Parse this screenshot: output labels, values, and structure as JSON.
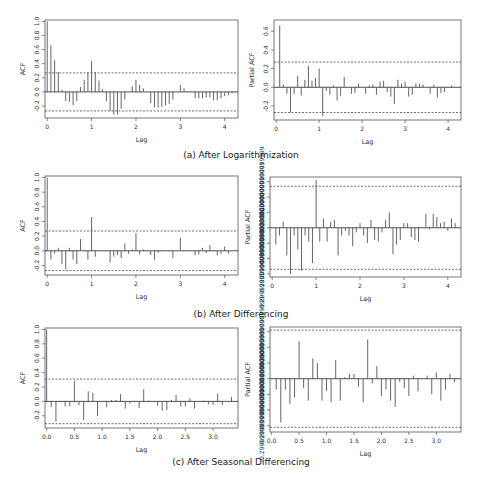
{
  "figure": {
    "captions": {
      "a": "(a) After Logarithmization",
      "b": "(b) After Differencing",
      "c": "(c) After Seasonal Differencing"
    }
  },
  "chart_data": [
    {
      "id": "a_acf",
      "type": "bar",
      "title": "",
      "xlabel": "Lag",
      "ylabel": "ACF",
      "xlim": [
        -0.05,
        4.3
      ],
      "ylim": [
        -0.37,
        1.02
      ],
      "xticks": [
        0,
        1,
        2,
        3,
        4
      ],
      "yticks": [
        -0.2,
        0.0,
        0.2,
        0.4,
        0.6,
        0.8,
        1.0
      ],
      "ci": 0.27,
      "grid": false,
      "x": [
        0,
        0.083,
        0.167,
        0.25,
        0.333,
        0.417,
        0.5,
        0.583,
        0.667,
        0.75,
        0.833,
        0.917,
        1.0,
        1.083,
        1.167,
        1.25,
        1.333,
        1.417,
        1.5,
        1.583,
        1.667,
        1.75,
        1.833,
        1.917,
        2.0,
        2.083,
        2.167,
        2.25,
        2.333,
        2.417,
        2.5,
        2.583,
        2.667,
        2.75,
        2.833,
        2.917,
        3.0,
        3.083,
        3.167,
        3.25,
        3.333,
        3.417,
        3.5,
        3.583,
        3.667,
        3.75,
        3.833,
        3.917,
        4.0,
        4.083,
        4.167
      ],
      "values": [
        1.0,
        0.66,
        0.45,
        0.28,
        0.03,
        -0.13,
        -0.14,
        -0.19,
        -0.13,
        0.07,
        0.17,
        0.28,
        0.44,
        0.28,
        0.16,
        0.04,
        -0.13,
        -0.27,
        -0.32,
        -0.32,
        -0.24,
        -0.11,
        0.0,
        0.08,
        0.17,
        0.1,
        0.05,
        0.0,
        -0.16,
        -0.22,
        -0.22,
        -0.21,
        -0.19,
        -0.17,
        -0.11,
        0.0,
        0.1,
        0.05,
        0.01,
        0.0,
        -0.09,
        -0.09,
        -0.09,
        -0.08,
        -0.08,
        -0.12,
        -0.12,
        -0.09,
        -0.06,
        -0.05,
        -0.02
      ]
    },
    {
      "id": "a_pacf",
      "type": "bar",
      "title": "",
      "xlabel": "Lag",
      "ylabel": "Partial ACF",
      "xlim": [
        -0.05,
        4.3
      ],
      "ylim": [
        -0.35,
        0.72
      ],
      "xticks": [
        0,
        1,
        2,
        3,
        4
      ],
      "yticks": [
        -0.2,
        0.0,
        0.2,
        0.4,
        0.6
      ],
      "ci": 0.27,
      "grid": false,
      "x": [
        0.083,
        0.167,
        0.25,
        0.333,
        0.417,
        0.5,
        0.583,
        0.667,
        0.75,
        0.833,
        0.917,
        1.0,
        1.083,
        1.167,
        1.25,
        1.333,
        1.417,
        1.5,
        1.583,
        1.667,
        1.75,
        1.833,
        1.917,
        2.0,
        2.083,
        2.167,
        2.25,
        2.333,
        2.417,
        2.5,
        2.583,
        2.667,
        2.75,
        2.833,
        2.917,
        3.0,
        3.083,
        3.167,
        3.25,
        3.333,
        3.417,
        3.5,
        3.583,
        3.667,
        3.75,
        3.833,
        3.917,
        4.0,
        4.083
      ],
      "values": [
        0.66,
        0.03,
        -0.07,
        -0.27,
        -0.07,
        0.12,
        -0.09,
        0.08,
        0.23,
        0.07,
        0.1,
        0.2,
        -0.31,
        -0.04,
        -0.08,
        0.02,
        -0.14,
        -0.09,
        0.11,
        0.0,
        -0.07,
        -0.06,
        0.04,
        0.0,
        -0.07,
        0.02,
        0.03,
        -0.08,
        0.06,
        0.07,
        -0.05,
        -0.1,
        -0.18,
        0.08,
        0.04,
        0.06,
        -0.1,
        -0.08,
        0.04,
        0.04,
        0.03,
        0.0,
        -0.07,
        0.03,
        -0.11,
        -0.06,
        -0.05,
        0.0,
        0.02
      ]
    },
    {
      "id": "b_acf",
      "type": "bar",
      "title": "",
      "xlabel": "Lag",
      "ylabel": "ACF",
      "xlim": [
        -0.05,
        4.3
      ],
      "ylim": [
        -0.33,
        1.02
      ],
      "xticks": [
        0,
        1,
        2,
        3,
        4
      ],
      "yticks": [
        -0.2,
        0.0,
        0.2,
        0.4,
        0.6,
        0.8,
        1.0
      ],
      "ci": 0.27,
      "grid": false,
      "x": [
        0,
        0.083,
        0.167,
        0.25,
        0.333,
        0.417,
        0.5,
        0.583,
        0.667,
        0.75,
        0.833,
        0.917,
        1.0,
        1.083,
        1.167,
        1.25,
        1.333,
        1.417,
        1.5,
        1.583,
        1.667,
        1.75,
        1.833,
        1.917,
        2.0,
        2.083,
        2.167,
        2.25,
        2.333,
        2.417,
        2.5,
        2.583,
        2.667,
        2.75,
        2.833,
        2.917,
        3.0,
        3.083,
        3.167,
        3.25,
        3.333,
        3.417,
        3.5,
        3.583,
        3.667,
        3.75,
        3.833,
        3.917,
        4.0,
        4.083,
        4.167
      ],
      "values": [
        1.0,
        -0.12,
        -0.04,
        0.04,
        -0.18,
        -0.25,
        0.04,
        -0.12,
        -0.18,
        0.16,
        0.01,
        -0.12,
        0.46,
        -0.08,
        0.01,
        0.01,
        0.0,
        -0.16,
        -0.08,
        -0.06,
        -0.1,
        0.1,
        -0.04,
        0.02,
        0.24,
        -0.05,
        0.02,
        0.01,
        -0.06,
        -0.12,
        -0.03,
        0.01,
        0.0,
        0.01,
        -0.1,
        0.0,
        0.18,
        0.01,
        0.01,
        0.0,
        -0.06,
        -0.05,
        0.04,
        -0.03,
        0.08,
        0.01,
        -0.06,
        -0.04,
        0.06,
        -0.04,
        0.0
      ]
    },
    {
      "id": "b_pacf",
      "type": "bar",
      "title": "",
      "xlabel": "Lag",
      "ylabel": "Partial ACF",
      "xlim": [
        -0.05,
        4.3
      ],
      "ylim": [
        -0.32,
        0.33
      ],
      "xticks": [
        0,
        1,
        2,
        3,
        4
      ],
      "yticks": [
        -0.3,
        -0.2,
        -0.1,
        0.0,
        0.1,
        0.2,
        0.3
      ],
      "ci": 0.27,
      "grid": false,
      "x": [
        0.083,
        0.167,
        0.25,
        0.333,
        0.417,
        0.5,
        0.583,
        0.667,
        0.75,
        0.833,
        0.917,
        1.0,
        1.083,
        1.167,
        1.25,
        1.333,
        1.417,
        1.5,
        1.583,
        1.667,
        1.75,
        1.833,
        1.917,
        2.0,
        2.083,
        2.167,
        2.25,
        2.333,
        2.417,
        2.5,
        2.583,
        2.667,
        2.75,
        2.833,
        2.917,
        3.0,
        3.083,
        3.167,
        3.25,
        3.333,
        3.417,
        3.5,
        3.583,
        3.667,
        3.75,
        3.833,
        3.917,
        4.0,
        4.083,
        4.167
      ],
      "values": [
        -0.11,
        -0.05,
        0.04,
        -0.18,
        -0.3,
        -0.05,
        -0.14,
        -0.28,
        -0.05,
        -0.09,
        -0.23,
        0.31,
        -0.09,
        0.06,
        -0.09,
        0.04,
        0.05,
        -0.18,
        -0.05,
        -0.02,
        -0.05,
        -0.12,
        -0.03,
        0.03,
        -0.05,
        -0.1,
        0.05,
        -0.08,
        -0.09,
        -0.03,
        0.05,
        0.1,
        -0.17,
        -0.11,
        -0.08,
        0.03,
        0.03,
        -0.06,
        -0.08,
        -0.09,
        0.0,
        0.09,
        -0.01,
        0.09,
        0.07,
        0.03,
        0.04,
        -0.02,
        0.06,
        0.03
      ]
    },
    {
      "id": "c_acf",
      "type": "bar",
      "title": "",
      "xlabel": "Lag",
      "ylabel": "ACF",
      "xlim": [
        -0.03,
        3.45
      ],
      "ylim": [
        -0.37,
        1.02
      ],
      "xticks": [
        0.0,
        0.5,
        1.0,
        1.5,
        2.0,
        2.5,
        3.0
      ],
      "yticks": [
        -0.2,
        0.0,
        0.2,
        0.4,
        0.6,
        0.8,
        1.0
      ],
      "ci": 0.31,
      "grid": false,
      "x": [
        0,
        0.083,
        0.167,
        0.25,
        0.333,
        0.417,
        0.5,
        0.583,
        0.667,
        0.75,
        0.833,
        0.917,
        1.0,
        1.083,
        1.167,
        1.25,
        1.333,
        1.417,
        1.5,
        1.583,
        1.667,
        1.75,
        1.833,
        1.917,
        2.0,
        2.083,
        2.167,
        2.25,
        2.333,
        2.417,
        2.5,
        2.583,
        2.667,
        2.75,
        2.833,
        2.917,
        3.0,
        3.083,
        3.167,
        3.25,
        3.333
      ],
      "values": [
        1.0,
        -0.08,
        -0.28,
        -0.01,
        -0.07,
        -0.07,
        0.29,
        -0.05,
        -0.26,
        0.14,
        0.12,
        -0.2,
        0.0,
        -0.08,
        0.02,
        0.02,
        0.1,
        -0.1,
        -0.03,
        0.0,
        -0.09,
        0.17,
        0.01,
        0.0,
        -0.06,
        -0.13,
        -0.12,
        0.02,
        0.09,
        -0.07,
        -0.07,
        0.04,
        -0.1,
        0.0,
        0.01,
        -0.04,
        -0.05,
        0.11,
        -0.05,
        0.0,
        0.06
      ]
    },
    {
      "id": "c_pacf",
      "type": "bar",
      "title": "",
      "xlabel": "Lag",
      "ylabel": "Partial ACF",
      "xlim": [
        -0.03,
        3.45
      ],
      "ylim": [
        -0.34,
        0.33
      ],
      "xticks": [
        0.0,
        0.5,
        1.0,
        1.5,
        2.0,
        2.5,
        3.0
      ],
      "yticks": [
        -0.3,
        -0.2,
        -0.1,
        0.0,
        0.1,
        0.2,
        0.3
      ],
      "ci": 0.31,
      "grid": false,
      "x": [
        0.083,
        0.167,
        0.25,
        0.333,
        0.417,
        0.5,
        0.583,
        0.667,
        0.75,
        0.833,
        0.917,
        1.0,
        1.083,
        1.167,
        1.25,
        1.333,
        1.417,
        1.5,
        1.583,
        1.667,
        1.75,
        1.833,
        1.917,
        2.0,
        2.083,
        2.167,
        2.25,
        2.333,
        2.417,
        2.5,
        2.583,
        2.667,
        2.75,
        2.833,
        2.917,
        3.0,
        3.083,
        3.167,
        3.25,
        3.333
      ],
      "values": [
        -0.07,
        -0.28,
        -0.07,
        -0.16,
        -0.12,
        0.24,
        -0.06,
        -0.14,
        0.13,
        0.1,
        -0.14,
        -0.08,
        -0.15,
        0.12,
        -0.14,
        0.01,
        0.03,
        0.03,
        -0.05,
        -0.15,
        0.25,
        -0.03,
        0.08,
        -0.11,
        -0.07,
        -0.14,
        -0.18,
        -0.02,
        -0.06,
        -0.11,
        0.02,
        -0.08,
        0.0,
        0.02,
        -0.1,
        0.04,
        -0.14,
        -0.07,
        0.03,
        -0.02
      ]
    }
  ],
  "panels": {
    "a_acf": {
      "box": [
        45,
        20,
        238,
        118
      ]
    },
    "a_pacf": {
      "box": [
        274,
        20,
        461,
        120
      ]
    },
    "b_acf": {
      "box": [
        45,
        176,
        238,
        275
      ]
    },
    "b_pacf": {
      "box": [
        270,
        177,
        461,
        277
      ]
    },
    "c_acf": {
      "box": [
        45,
        328,
        238,
        428
      ]
    },
    "c_pacf": {
      "box": [
        270,
        327,
        461,
        432
      ]
    }
  },
  "colors": {
    "frame": "#555555",
    "bar": "#555555",
    "ci_line": "#333333",
    "text": "#333333"
  }
}
